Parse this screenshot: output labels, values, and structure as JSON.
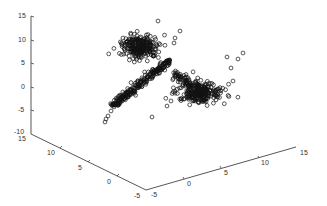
{
  "chart_data": {
    "type": "scatter",
    "projection": "3d",
    "title": "",
    "xlabel": "",
    "ylabel": "",
    "zlabel": "",
    "marker": "open-circle",
    "marker_color": "#111111",
    "grid": false,
    "legend": null,
    "axes": {
      "x": {
        "range": [
          -5,
          15
        ],
        "ticks": [
          -5,
          0,
          5,
          10,
          15
        ],
        "tick_labels": [
          "-5",
          "0",
          "5",
          "10",
          "15"
        ]
      },
      "y": {
        "range": [
          -5,
          15
        ],
        "ticks": [
          -5,
          0,
          5,
          10,
          15
        ],
        "tick_labels": [
          "-5",
          "0",
          "5",
          "10",
          "15"
        ]
      },
      "z": {
        "range": [
          -10,
          15
        ],
        "ticks": [
          -10,
          -5,
          0,
          5,
          10,
          15
        ],
        "tick_labels": [
          "-10",
          "-5",
          "0",
          "5",
          "10",
          "15"
        ]
      }
    },
    "series": [
      {
        "name": "cluster-upper",
        "description": "dense blob, upper left",
        "center_px": [
          140,
          47
        ],
        "spread_px": [
          12,
          8
        ],
        "count": 260,
        "approx_center_xyz": [
          0,
          8,
          8
        ]
      },
      {
        "name": "diagonal-line",
        "description": "dense elongated band along a line",
        "from_px": [
          112,
          106
        ],
        "to_px": [
          170,
          60
        ],
        "width_px": 3.2,
        "count": 240,
        "tail_points_px": [
          [
            105,
            122
          ],
          [
            108,
            116
          ],
          [
            111,
            111
          ],
          [
            114,
            107
          ],
          [
            118,
            103
          ],
          [
            106,
            119
          ]
        ]
      },
      {
        "name": "cluster-lower-right",
        "description": "blob with short line segment, lower right",
        "center_px": [
          200,
          93
        ],
        "spread_px": [
          16,
          7
        ],
        "count": 240,
        "segment_from_px": [
          172,
          72
        ],
        "segment_to_px": [
          205,
          92
        ],
        "segment_count": 90
      }
    ],
    "outliers_px": [
      [
        158,
        21
      ],
      [
        180,
        31
      ],
      [
        175,
        38
      ],
      [
        174,
        43
      ],
      [
        243,
        53
      ],
      [
        238,
        59
      ],
      [
        227,
        57
      ],
      [
        231,
        68
      ],
      [
        233,
        81
      ],
      [
        152,
        117
      ],
      [
        130,
        94
      ],
      [
        171,
        101
      ],
      [
        167,
        106
      ]
    ],
    "projection_px": {
      "z_axis": {
        "x": 31,
        "y_top": 16,
        "y_bottom": 134
      },
      "left_base": {
        "from": [
          31,
          134
        ],
        "to": [
          146,
          190
        ]
      },
      "right_base": {
        "from": [
          146,
          190
        ],
        "to": [
          296,
          147
        ]
      }
    }
  },
  "labels": {
    "z": [
      "15",
      "10",
      "5",
      "0",
      "-5",
      "-10"
    ],
    "left": [
      "15",
      "10",
      "5",
      "0",
      "-5"
    ],
    "right": [
      "-5",
      "0",
      "5",
      "10",
      "15"
    ]
  }
}
